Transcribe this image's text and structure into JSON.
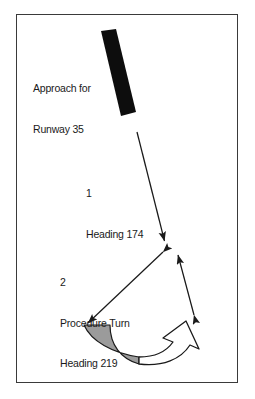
{
  "figure": {
    "kind": "aviation-procedure-turn-diagram",
    "border_color": "#3a3a3a",
    "background": "#ffffff"
  },
  "labels": {
    "runway": {
      "line1": "Approach for",
      "line2": "Runway 35"
    },
    "leg1": {
      "number": "1",
      "text": "Heading 174"
    },
    "leg2": {
      "number": "2",
      "line1": "Procedure Turn",
      "line2": "Heading 219"
    }
  },
  "shapes": {
    "runway_bar": {
      "name": "runway-strip",
      "color": "#0d0d0d",
      "points": "101,31 116,29 136,112 121,116"
    },
    "inbound_leg": {
      "name": "inbound-course-arrow",
      "color": "#1a1a1a",
      "from_x": 137,
      "from_y": 132,
      "to_x": 166,
      "to_y": 246
    },
    "procedure_turn_leg": {
      "name": "procedure-turn-arrow",
      "color": "#1a1a1a",
      "from_x": 166,
      "from_y": 250,
      "to_x": 85,
      "to_y": 326
    },
    "outbound_leg": {
      "name": "outbound-course-arrow",
      "color": "#1a1a1a",
      "from_x": 196,
      "from_y": 317,
      "to_x": 177,
      "to_y": 251
    },
    "turn_band": {
      "name": "shaded-turn-band",
      "fill": "#9b9b9b",
      "stroke": "#1a1a1a"
    },
    "reversal_arrow": {
      "name": "course-reversal-arrow",
      "fill": "#ffffff",
      "stroke": "#1a1a1a"
    }
  },
  "colors": {
    "ink": "#1a1a1a",
    "runway_black": "#0d0d0d",
    "band_gray": "#9b9b9b",
    "frame": "#3a3a3a"
  }
}
